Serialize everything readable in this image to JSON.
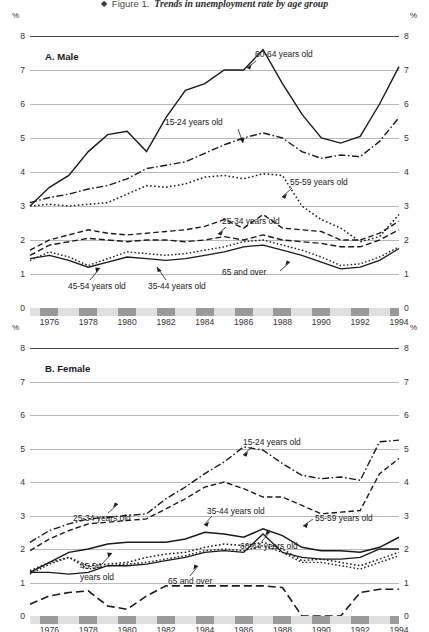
{
  "figure": {
    "bullet": "◆",
    "number": "Figure 1.",
    "caption": "Trends in unemployment rate by age group"
  },
  "axis": {
    "y_ticks": [
      "8",
      "7",
      "6",
      "5",
      "4",
      "3",
      "2",
      "1",
      "0"
    ],
    "y_unit": "%",
    "x_ticks": [
      "1976",
      "1978",
      "1980",
      "1982",
      "1984",
      "1986",
      "1988",
      "1990",
      "1992",
      "1994"
    ],
    "ylim": [
      0,
      8
    ],
    "xlim": [
      1975,
      1994
    ]
  },
  "panels": {
    "a": {
      "label": "A.  Male"
    },
    "b": {
      "label": "B.  Female"
    }
  },
  "labels": {
    "a_6064": "60-64 years old",
    "a_1524": "15-24 years old",
    "a_5559": "55-59 years old",
    "a_2534": "25-34 years old",
    "a_4554": "45-54 years old",
    "a_3544": "35-44 years old",
    "a_65": "65 and over",
    "b_1524": "15-24 years old",
    "b_2534": "25-34 years old",
    "b_3544": "35-44 years old",
    "b_5559": "55-59 years old",
    "b_6064": "60-64 years old",
    "b_4554_l1": "45-54",
    "b_4554_l2": "years old",
    "b_65": "65 and over"
  },
  "chart_data": {
    "type": "line",
    "title": "Trends in unemployment rate by age group",
    "xlabel": "",
    "ylabel": "%",
    "ylim": [
      0,
      8
    ],
    "grid": true,
    "legend": "inline annotations",
    "x": [
      1975,
      1976,
      1977,
      1978,
      1979,
      1980,
      1981,
      1982,
      1983,
      1984,
      1985,
      1986,
      1987,
      1988,
      1989,
      1990,
      1991,
      1992,
      1993,
      1994
    ],
    "panels": [
      {
        "name": "A. Male",
        "series": [
          {
            "name": "60-64 years old",
            "style": "solid",
            "values": [
              3.0,
              3.55,
              3.9,
              4.6,
              5.1,
              5.2,
              4.6,
              5.6,
              6.4,
              6.6,
              7.0,
              7.0,
              7.6,
              6.6,
              5.7,
              5.0,
              4.85,
              5.05,
              6.0,
              7.1
            ]
          },
          {
            "name": "15-24 years old",
            "style": "dashdot",
            "values": [
              3.1,
              3.25,
              3.35,
              3.5,
              3.6,
              3.8,
              4.1,
              4.2,
              4.3,
              4.55,
              4.8,
              5.0,
              5.15,
              5.0,
              4.6,
              4.4,
              4.5,
              4.45,
              4.9,
              5.6
            ]
          },
          {
            "name": "55-59 years old",
            "style": "dotted",
            "values": [
              3.0,
              3.05,
              3.0,
              3.05,
              3.1,
              3.35,
              3.6,
              3.55,
              3.65,
              3.85,
              3.9,
              3.8,
              3.95,
              3.9,
              3.0,
              2.6,
              2.35,
              1.95,
              2.1,
              2.75
            ]
          },
          {
            "name": "25-34 years old",
            "style": "longdash",
            "values": [
              1.55,
              1.85,
              1.95,
              2.05,
              2.0,
              1.95,
              2.0,
              2.0,
              1.95,
              2.0,
              2.1,
              2.0,
              2.15,
              2.0,
              1.95,
              1.9,
              1.8,
              1.8,
              2.0,
              2.3
            ]
          },
          {
            "name": "35-44 years old",
            "style": "dotted",
            "values": [
              1.4,
              1.65,
              1.5,
              1.25,
              1.45,
              1.65,
              1.6,
              1.55,
              1.6,
              1.7,
              1.8,
              1.95,
              2.0,
              1.85,
              1.7,
              1.5,
              1.25,
              1.3,
              1.5,
              1.8
            ]
          },
          {
            "name": "45-54 years old",
            "style": "solid",
            "values": [
              1.45,
              1.55,
              1.4,
              1.2,
              1.35,
              1.5,
              1.45,
              1.4,
              1.45,
              1.55,
              1.65,
              1.8,
              1.85,
              1.7,
              1.55,
              1.35,
              1.15,
              1.2,
              1.4,
              1.75
            ]
          },
          {
            "name": "65 and over",
            "style": "dashed",
            "values": [
              1.7,
              2.0,
              2.15,
              2.3,
              2.2,
              2.15,
              2.2,
              2.25,
              2.3,
              2.4,
              2.6,
              2.35,
              2.75,
              2.35,
              2.3,
              2.25,
              2.0,
              2.0,
              2.2,
              2.55
            ]
          }
        ]
      },
      {
        "name": "B. Female",
        "series": [
          {
            "name": "15-24 years old",
            "style": "dashdot",
            "values": [
              2.2,
              2.55,
              2.75,
              2.9,
              2.95,
              3.0,
              3.05,
              3.5,
              3.85,
              4.25,
              4.6,
              5.05,
              4.95,
              4.55,
              4.2,
              4.1,
              4.15,
              4.05,
              5.2,
              5.25
            ]
          },
          {
            "name": "25-34 years old",
            "style": "dashed",
            "values": [
              1.95,
              2.3,
              2.55,
              2.75,
              2.8,
              2.85,
              2.9,
              3.2,
              3.5,
              3.85,
              4.0,
              3.8,
              3.55,
              3.55,
              3.3,
              3.05,
              3.1,
              3.15,
              4.25,
              4.7
            ]
          },
          {
            "name": "35-44 years old",
            "style": "solid",
            "values": [
              1.3,
              1.6,
              1.9,
              2.0,
              2.15,
              2.2,
              2.2,
              2.2,
              2.3,
              2.5,
              2.45,
              2.35,
              2.6,
              2.4,
              2.05,
              1.95,
              1.95,
              1.9,
              2.05,
              2.35
            ]
          },
          {
            "name": "55-59 years old",
            "style": "solid",
            "values": [
              1.3,
              1.3,
              1.25,
              1.3,
              1.5,
              1.5,
              1.55,
              1.65,
              1.75,
              1.9,
              1.95,
              1.9,
              2.45,
              1.9,
              1.75,
              1.7,
              1.7,
              1.75,
              2.0,
              2.0
            ]
          },
          {
            "name": "60-64 years old",
            "style": "dotted",
            "values": [
              1.35,
              1.6,
              1.75,
              1.5,
              1.55,
              1.6,
              1.75,
              1.85,
              1.9,
              2.05,
              2.15,
              2.1,
              2.2,
              2.0,
              1.65,
              1.7,
              1.6,
              1.5,
              1.7,
              1.9
            ]
          },
          {
            "name": "45-54 years old",
            "style": "dotted",
            "values": [
              1.25,
              1.55,
              1.75,
              1.4,
              1.5,
              1.55,
              1.6,
              1.7,
              1.8,
              1.95,
              2.0,
              1.95,
              2.1,
              1.9,
              1.6,
              1.6,
              1.5,
              1.4,
              1.6,
              1.8
            ]
          },
          {
            "name": "65 and over",
            "style": "longdash",
            "values": [
              0.35,
              0.6,
              0.7,
              0.75,
              0.3,
              0.2,
              0.6,
              0.9,
              0.9,
              0.9,
              0.9,
              0.9,
              0.9,
              0.85,
              0.0,
              0.0,
              0.0,
              0.7,
              0.8,
              0.8
            ]
          }
        ]
      }
    ]
  }
}
